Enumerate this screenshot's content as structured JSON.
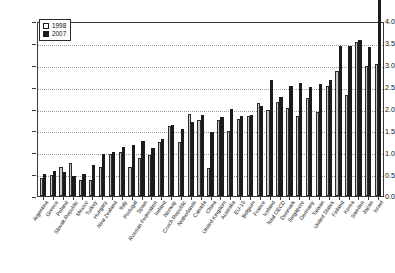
{
  "chart_data": {
    "type": "bar",
    "title": "",
    "xlabel": "",
    "ylabel": "",
    "ylim": [
      0.0,
      4.0
    ],
    "yticks": [
      "0.0",
      "0.5",
      "1.0",
      "1.5",
      "2.0",
      "2.5",
      "3.0",
      "3.5",
      "4.0"
    ],
    "ytick_values": [
      0.0,
      0.5,
      1.0,
      1.5,
      2.0,
      2.5,
      3.0,
      3.5,
      4.0
    ],
    "grid": true,
    "legend_position": "top-left",
    "categories": [
      "Argentina",
      "Greece",
      "Poland",
      "Slovak Republic",
      "Mexico",
      "Turkey",
      "Hungary",
      "New Zealand",
      "Italy",
      "Portugal",
      "Spain",
      "Russian Federation",
      "Ireland",
      "Norway",
      "Czech Republic",
      "Netherlands",
      "Canada",
      "China",
      "United Kingdom",
      "Australia",
      "EU-15",
      "Belgium",
      "France",
      "Iceland",
      "Total OECD",
      "Denmark",
      "Singapore",
      "Germany",
      "Taiwan",
      "United States",
      "Finland",
      "Korea",
      "Sweden",
      "Japan",
      "Israel"
    ],
    "series": [
      {
        "name": "1998",
        "color": "#c9c9c9",
        "values": [
          0.41,
          0.49,
          0.67,
          0.76,
          0.38,
          0.37,
          0.66,
          0.97,
          1.02,
          0.68,
          0.87,
          0.95,
          1.24,
          1.63,
          1.24,
          1.9,
          1.76,
          0.65,
          1.76,
          1.51,
          1.79,
          1.86,
          2.14,
          2.0,
          2.17,
          2.04,
          1.85,
          2.27,
          1.94,
          2.55,
          2.88,
          2.34,
          3.55,
          3.0,
          3.06
        ]
      },
      {
        "name": "2007",
        "color": "#1b1b1b",
        "values": [
          0.51,
          0.57,
          0.56,
          0.46,
          0.5,
          0.72,
          0.97,
          1.02,
          1.13,
          1.18,
          1.27,
          1.12,
          1.31,
          1.64,
          1.54,
          1.7,
          1.88,
          1.49,
          1.82,
          2.01,
          1.84,
          1.87,
          2.08,
          2.68,
          2.28,
          2.55,
          2.61,
          2.53,
          2.58,
          2.68,
          3.47,
          3.47,
          3.6,
          3.44,
          4.65
        ]
      }
    ]
  },
  "legend": {
    "entries": [
      {
        "label": "1998"
      },
      {
        "label": "2007"
      }
    ]
  },
  "colors": {
    "series_1998": "#c9c9c9",
    "series_2007": "#1b1b1b",
    "axis": "#3a3a3a",
    "grid": "#9a9a9a",
    "text": "#111111",
    "background": "#ffffff"
  }
}
